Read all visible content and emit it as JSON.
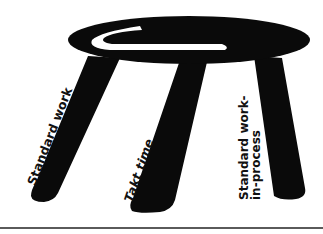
{
  "figure": {
    "colors": {
      "stool": "#0a0a0a",
      "highlight": "#ffffff",
      "rule": "#5a5a5a",
      "text": "#111111"
    },
    "legs": [
      {
        "id": "left",
        "label": "Standard work"
      },
      {
        "id": "middle",
        "label": "Takt time"
      },
      {
        "id": "right",
        "label_line1": "Standard work-",
        "label_line2": "in-process"
      }
    ]
  }
}
